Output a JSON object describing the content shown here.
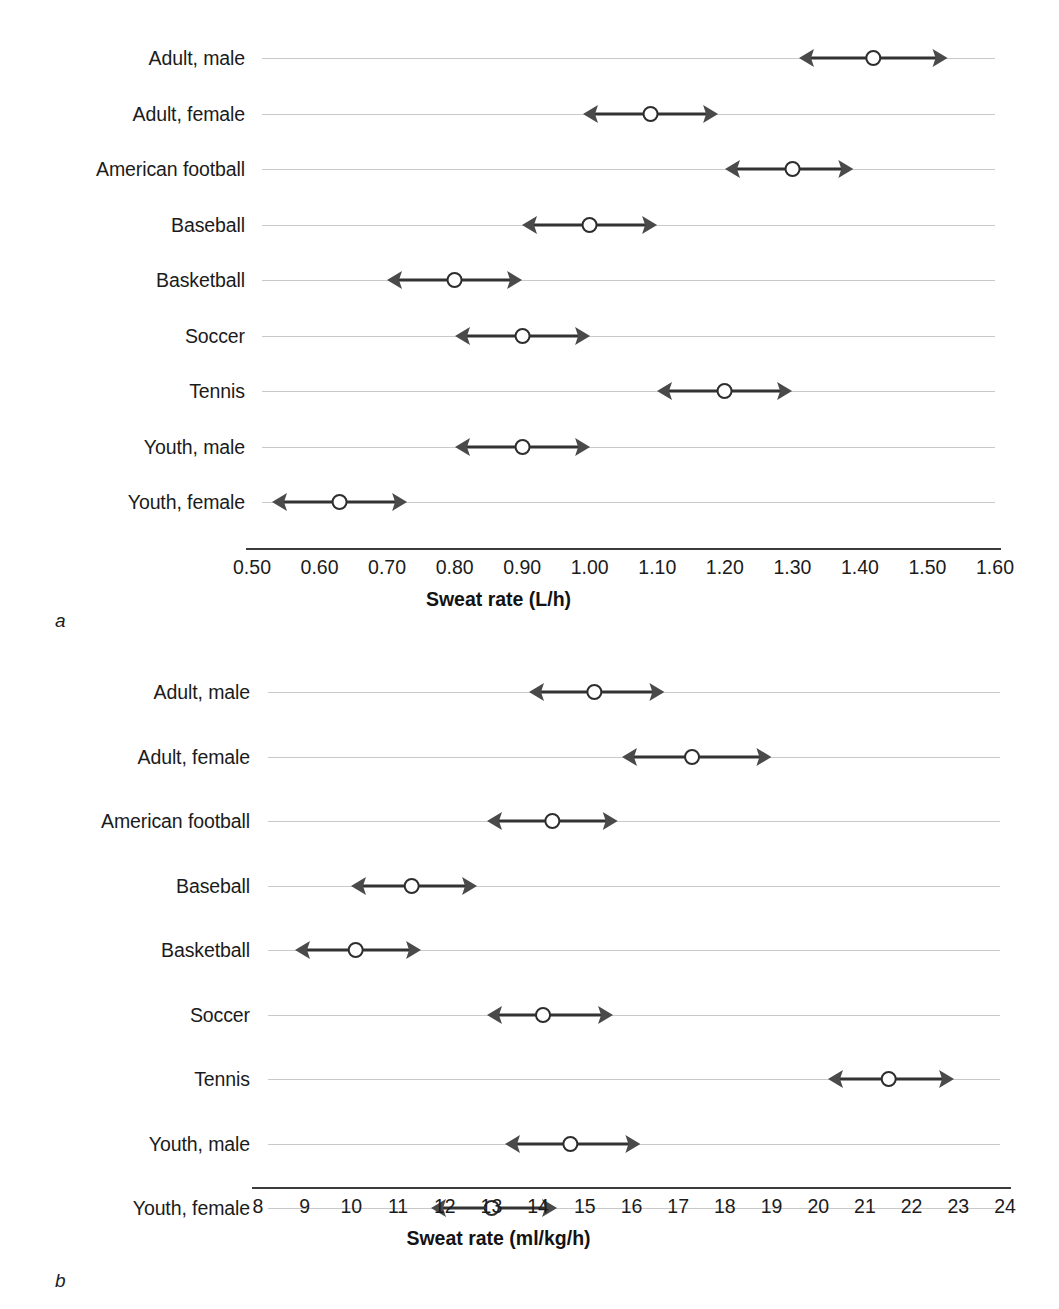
{
  "figure": {
    "panel_a_letter": "a",
    "panel_b_letter": "b"
  },
  "chart_data": [
    {
      "type": "scatter",
      "panel": "a",
      "title": "",
      "xlabel": "Sweat rate (L/h)",
      "ylabel": "",
      "xlim": [
        0.5,
        1.6
      ],
      "xticks": [
        "0.50",
        "0.60",
        "0.70",
        "0.80",
        "0.90",
        "1.00",
        "1.10",
        "1.20",
        "1.30",
        "1.40",
        "1.50",
        "1.60"
      ],
      "xtick_values": [
        0.5,
        0.6,
        0.7,
        0.8,
        0.9,
        1.0,
        1.1,
        1.2,
        1.3,
        1.4,
        1.5,
        1.6
      ],
      "grid": true,
      "legend": "none",
      "marker": "open-circle-with-double-arrow-range",
      "categories": [
        "Adult, male",
        "Adult, female",
        "American football",
        "Baseball",
        "Basketball",
        "Soccer",
        "Tennis",
        "Youth, male",
        "Youth, female"
      ],
      "values": [
        1.42,
        1.09,
        1.3,
        1.0,
        0.8,
        0.9,
        1.2,
        0.9,
        0.63
      ],
      "range_low": [
        1.31,
        0.99,
        1.2,
        0.9,
        0.7,
        0.8,
        1.1,
        0.8,
        0.53
      ],
      "range_high": [
        1.53,
        1.19,
        1.39,
        1.1,
        0.9,
        1.0,
        1.3,
        1.0,
        0.73
      ]
    },
    {
      "type": "scatter",
      "panel": "b",
      "title": "",
      "xlabel": "Sweat rate (ml/kg/h)",
      "ylabel": "",
      "xlim": [
        8,
        24
      ],
      "xticks": [
        "8",
        "9",
        "10",
        "11",
        "12",
        "13",
        "14",
        "15",
        "16",
        "17",
        "18",
        "19",
        "20",
        "21",
        "22",
        "23",
        "24"
      ],
      "xtick_values": [
        8,
        9,
        10,
        11,
        12,
        13,
        14,
        15,
        16,
        17,
        18,
        19,
        20,
        21,
        22,
        23,
        24
      ],
      "grid": true,
      "legend": "none",
      "marker": "open-circle-with-double-arrow-range",
      "categories": [
        "Adult, male",
        "Adult, female",
        "American football",
        "Baseball",
        "Basketball",
        "Soccer",
        "Tennis",
        "Youth, male",
        "Youth, female"
      ],
      "values": [
        15.2,
        17.3,
        14.3,
        11.3,
        10.1,
        14.1,
        21.5,
        14.7,
        13.0
      ],
      "range_low": [
        13.8,
        15.8,
        12.9,
        10.0,
        8.8,
        12.9,
        20.2,
        13.3,
        11.7
      ],
      "range_high": [
        16.7,
        19.0,
        15.7,
        12.7,
        11.5,
        15.6,
        22.9,
        16.2,
        14.4
      ]
    }
  ]
}
